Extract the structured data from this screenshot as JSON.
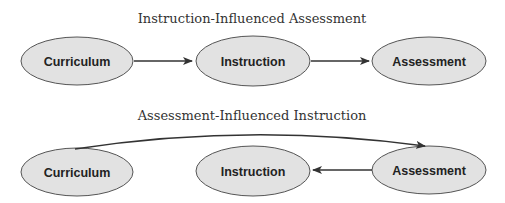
{
  "diagrams": [
    {
      "title": "Instruction-Influenced Assessment",
      "nodes": [
        {
          "id": "curriculum",
          "label": "Curriculum"
        },
        {
          "id": "instruction",
          "label": "Instruction"
        },
        {
          "id": "assessment",
          "label": "Assessment"
        }
      ],
      "edges": [
        {
          "from": "curriculum",
          "to": "instruction"
        },
        {
          "from": "instruction",
          "to": "assessment"
        }
      ]
    },
    {
      "title": "Assessment-Influenced Instruction",
      "nodes": [
        {
          "id": "curriculum",
          "label": "Curriculum"
        },
        {
          "id": "instruction",
          "label": "Instruction"
        },
        {
          "id": "assessment",
          "label": "Assessment"
        }
      ],
      "edges": [
        {
          "from": "curriculum",
          "to": "assessment",
          "style": "curved"
        },
        {
          "from": "assessment",
          "to": "instruction"
        }
      ]
    }
  ],
  "colors": {
    "node_fill": "#e2e2e2",
    "node_stroke": "#555555",
    "edge": "#333333",
    "title": "#333333"
  }
}
